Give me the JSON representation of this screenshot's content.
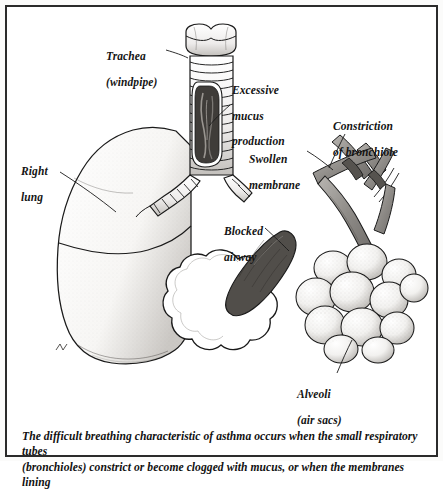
{
  "figure": {
    "frame_color": "#2b2b2b",
    "background_color": "#ffffff",
    "ink_color": "#1a1a1a"
  },
  "labels": {
    "right_lung": {
      "line1": "Right",
      "line2": "lung"
    },
    "trachea": {
      "line1": "Trachea",
      "line2": "(windpipe)"
    },
    "mucus": {
      "line1": "Excessive",
      "line2": "mucus",
      "line3": "production"
    },
    "constriction": {
      "line1": "Constriction",
      "line2": "of bronchiole"
    },
    "swollen_membrane": {
      "line1": "Swollen",
      "line2": "membrane"
    },
    "blocked_airway": {
      "line1": "Blocked",
      "line2": "airway"
    },
    "alveoli": {
      "line1": "Alveoli",
      "line2": "(air sacs)"
    }
  },
  "caption": {
    "line1": "The difficult breathing characteristic of asthma occurs when the small respiratory tubes",
    "line2": "(bronchioles) constrict or become clogged with mucus, or when the membranes lining"
  }
}
